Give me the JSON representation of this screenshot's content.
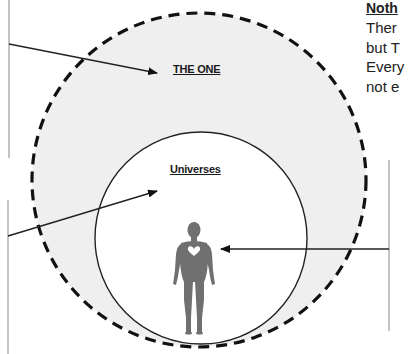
{
  "diagram": {
    "outer_circle": {
      "label": "THE ONE",
      "fill": "#efefef",
      "stroke": "#111111",
      "style": "dashed"
    },
    "inner_circle": {
      "label": "Universes",
      "fill": "#ffffff",
      "stroke": "#222222",
      "style": "solid"
    },
    "figure": {
      "icon": "human-figure-with-heart",
      "color": "#707070"
    },
    "side_text": {
      "heading": "Noth",
      "lines": [
        "Ther",
        "but T",
        "Every",
        "not e"
      ]
    },
    "colors": {
      "background": "#ffffff",
      "line": "#222222",
      "box_border": "#888888"
    }
  }
}
